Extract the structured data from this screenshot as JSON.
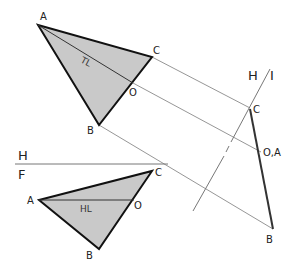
{
  "diagram": {
    "type": "descriptive-geometry-auxiliary-view",
    "colors": {
      "fill": "#c9c9c9",
      "edge": "#111111",
      "projector": "#888888",
      "folding_line": "#777777",
      "text": "#222222"
    },
    "top_view": {
      "points": {
        "A": {
          "x": 38,
          "y": 25,
          "label": "A"
        },
        "B": {
          "x": 99,
          "y": 125,
          "label": "B"
        },
        "C": {
          "x": 152,
          "y": 57,
          "label": "C"
        },
        "O": {
          "x": 133,
          "y": 83,
          "label": "O"
        }
      },
      "line_label": "TL"
    },
    "front_view": {
      "points": {
        "A": {
          "x": 39,
          "y": 200,
          "label": "A"
        },
        "B": {
          "x": 99,
          "y": 249,
          "label": "B"
        },
        "C": {
          "x": 152,
          "y": 171,
          "label": "C"
        },
        "O": {
          "x": 134,
          "y": 200,
          "label": "O"
        }
      },
      "line_label": "HL"
    },
    "edge_view": {
      "points": {
        "C": {
          "x": 250,
          "y": 108,
          "label": "C"
        },
        "OA": {
          "x": 261,
          "y": 152,
          "label": "O,A"
        },
        "B": {
          "x": 273,
          "y": 229,
          "label": "B"
        }
      }
    },
    "folding_lines": {
      "hf": {
        "upper_label": "H",
        "lower_label": "F"
      },
      "hi": {
        "left_label": "H",
        "right_label": "I"
      }
    }
  }
}
